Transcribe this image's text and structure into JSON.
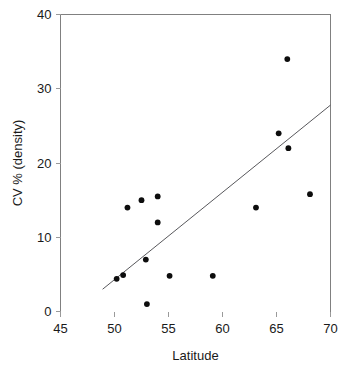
{
  "chart_data": {
    "type": "scatter",
    "title": "",
    "xlabel": "Latitude",
    "ylabel": "CV % (density)",
    "xlim": [
      45,
      70
    ],
    "ylim": [
      0,
      40
    ],
    "xticks": [
      45,
      50,
      55,
      60,
      65,
      70
    ],
    "yticks": [
      0,
      10,
      20,
      30,
      40
    ],
    "xtick_labels": [
      "45",
      "50",
      "55",
      "60",
      "65",
      "70"
    ],
    "ytick_labels": [
      "0",
      "10",
      "20",
      "30",
      "40"
    ],
    "grid": false,
    "legend": false,
    "legend_position": "none",
    "marker": "filled-circle",
    "marker_color": "#0d0d0d",
    "points": [
      {
        "x": 50.2,
        "y": 4.4
      },
      {
        "x": 50.8,
        "y": 4.9
      },
      {
        "x": 51.2,
        "y": 14.0
      },
      {
        "x": 52.5,
        "y": 15.0
      },
      {
        "x": 52.9,
        "y": 7.0
      },
      {
        "x": 53.0,
        "y": 1.0
      },
      {
        "x": 54.0,
        "y": 15.5
      },
      {
        "x": 54.0,
        "y": 12.0
      },
      {
        "x": 55.1,
        "y": 4.8
      },
      {
        "x": 59.1,
        "y": 4.8
      },
      {
        "x": 63.1,
        "y": 14.0
      },
      {
        "x": 65.2,
        "y": 24.0
      },
      {
        "x": 66.0,
        "y": 34.0
      },
      {
        "x": 66.1,
        "y": 22.0
      },
      {
        "x": 68.1,
        "y": 15.8
      }
    ],
    "trend_line": {
      "label": "regression line",
      "color": "#58585c",
      "x_start": 48.9,
      "y_start": 3.0,
      "x_end": 70.0,
      "y_end": 27.8
    }
  },
  "caption": {
    "cropped_top_text": ""
  }
}
